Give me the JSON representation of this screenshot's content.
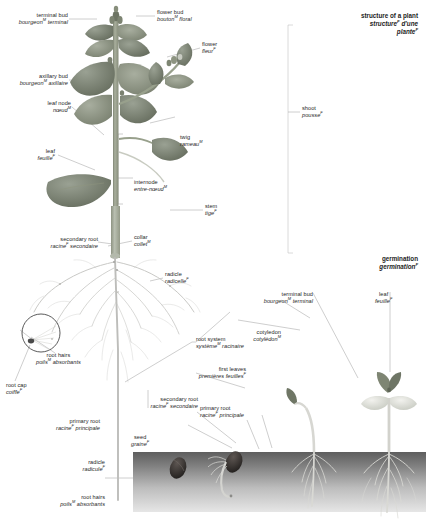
{
  "canvas": {
    "width": 426,
    "height": 526,
    "background": "#ffffff"
  },
  "palette": {
    "leaf_dark": "#6f7668",
    "leaf_mid": "#8f968a",
    "leaf_light": "#aeb4a8",
    "stem": "#9aa08f",
    "root": "#c3c3c0",
    "soil_top": "#6a6a6a",
    "soil_bottom": "#e2e2e2",
    "seed": "#3f3b38",
    "leader_line": "#9a9a9a",
    "text": "#262626"
  },
  "titles": [
    {
      "name": "main-title",
      "en": "structure of a plant",
      "fr_line1": "structure",
      "fr_sup1": "F",
      "fr_line1_tail": " d'une",
      "fr_line2": "plante",
      "fr_sup2": "F"
    },
    {
      "name": "germination-title",
      "en": "germination",
      "fr": "germination",
      "fr_sup": "F"
    }
  ],
  "labels": [
    {
      "id": "terminal-bud",
      "en": "terminal bud",
      "fr": "bourgeon",
      "sup": "M",
      "fr_tail": " terminal"
    },
    {
      "id": "flower-bud",
      "en": "flower bud",
      "fr": "bouton",
      "sup": "M",
      "fr_tail": " floral"
    },
    {
      "id": "flower",
      "en": "flower",
      "fr": "fleur",
      "sup": "F",
      "fr_tail": ""
    },
    {
      "id": "axillary-bud",
      "en": "axillary bud",
      "fr": "bourgeon",
      "sup": "M",
      "fr_tail": " axillaire"
    },
    {
      "id": "leaf-node",
      "en": "leaf node",
      "fr": "nœud",
      "sup": "M",
      "fr_tail": ""
    },
    {
      "id": "twig",
      "en": "twig",
      "fr": "rameau",
      "sup": "M",
      "fr_tail": ""
    },
    {
      "id": "leaf",
      "en": "leaf",
      "fr": "feuille",
      "sup": "F",
      "fr_tail": ""
    },
    {
      "id": "internode",
      "en": "internode",
      "fr": "entre-nœud",
      "sup": "M",
      "fr_tail": ""
    },
    {
      "id": "stem",
      "en": "stem",
      "fr": "tige",
      "sup": "F",
      "fr_tail": ""
    },
    {
      "id": "shoot",
      "en": "shoot",
      "fr": "pousse",
      "sup": "F",
      "fr_tail": ""
    },
    {
      "id": "collar",
      "en": "collar",
      "fr": "collet",
      "sup": "M",
      "fr_tail": ""
    },
    {
      "id": "secondary-root",
      "en": "secondary root",
      "fr": "racine",
      "sup": "F",
      "fr_tail": " secondaire"
    },
    {
      "id": "radicle-upper",
      "en": "radicle",
      "fr": "radicelle",
      "sup": "F",
      "fr_tail": ""
    },
    {
      "id": "root-hairs-upper",
      "en": "root hairs",
      "fr": "poils",
      "sup": "M",
      "fr_tail": " absorbants"
    },
    {
      "id": "root-cap",
      "en": "root cap",
      "fr": "coiffe",
      "sup": "F",
      "fr_tail": ""
    },
    {
      "id": "root-system",
      "en": "root system",
      "fr": "système",
      "sup": "M",
      "fr_tail": " racinaire"
    },
    {
      "id": "primary-root-left",
      "en": "primary root",
      "fr": "racine",
      "sup": "F",
      "fr_tail": " principale"
    },
    {
      "id": "secondary-root-g",
      "en": "secondary root",
      "fr": "racine",
      "sup": "F",
      "fr_tail": " secondaire"
    },
    {
      "id": "primary-root-g",
      "en": "primary root",
      "fr": "racine",
      "sup": "F",
      "fr_tail": " principale"
    },
    {
      "id": "seed",
      "en": "seed",
      "fr": "graine",
      "sup": "F",
      "fr_tail": ""
    },
    {
      "id": "radicle-lower",
      "en": "radicle",
      "fr": "radicule",
      "sup": "F",
      "fr_tail": ""
    },
    {
      "id": "root-hairs-lower",
      "en": "root hairs",
      "fr": "poils",
      "sup": "M",
      "fr_tail": " absorbants"
    },
    {
      "id": "first-leaves",
      "en": "first leaves",
      "fr": "premières",
      "sup": "",
      "fr_tail": " feuilles",
      "fr_tail_sup": "F"
    },
    {
      "id": "cotyledon",
      "en": "cotyledon",
      "fr": "cotylédon",
      "sup": "M",
      "fr_tail": ""
    },
    {
      "id": "terminal-bud-g",
      "en": "terminal bud",
      "fr": "bourgeon",
      "sup": "M",
      "fr_tail": " terminal"
    },
    {
      "id": "leaf-g",
      "en": "leaf",
      "fr": "feuille",
      "sup": "F",
      "fr_tail": ""
    }
  ]
}
